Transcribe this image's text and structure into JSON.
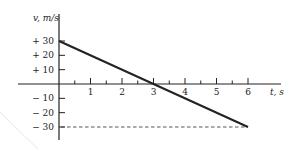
{
  "chart_data": {
    "type": "line",
    "title": "",
    "xlabel": "t, s",
    "ylabel": "v, m/s",
    "xlim": [
      0,
      6.6
    ],
    "ylim": [
      -30,
      30
    ],
    "x_ticks": [
      1,
      2,
      3,
      4,
      5,
      6
    ],
    "x_minor_ticks": [
      0.5,
      1.5,
      2.5,
      3.5,
      4.5,
      5.5
    ],
    "y_ticks": [
      {
        "value": 30,
        "label": "+ 30"
      },
      {
        "value": 20,
        "label": "+ 20"
      },
      {
        "value": 10,
        "label": "+ 10"
      },
      {
        "value": -10,
        "label": "− 10"
      },
      {
        "value": -20,
        "label": "− 20"
      },
      {
        "value": -30,
        "label": "− 30"
      }
    ],
    "grid": false,
    "series": [
      {
        "name": "velocity",
        "x": [
          0,
          6
        ],
        "y": [
          30,
          -30
        ],
        "style": "solid"
      }
    ],
    "reference_lines": [
      {
        "name": "v=-30 guide",
        "x": [
          0,
          6
        ],
        "y": [
          -30,
          -30
        ],
        "style": "dashed"
      }
    ]
  }
}
